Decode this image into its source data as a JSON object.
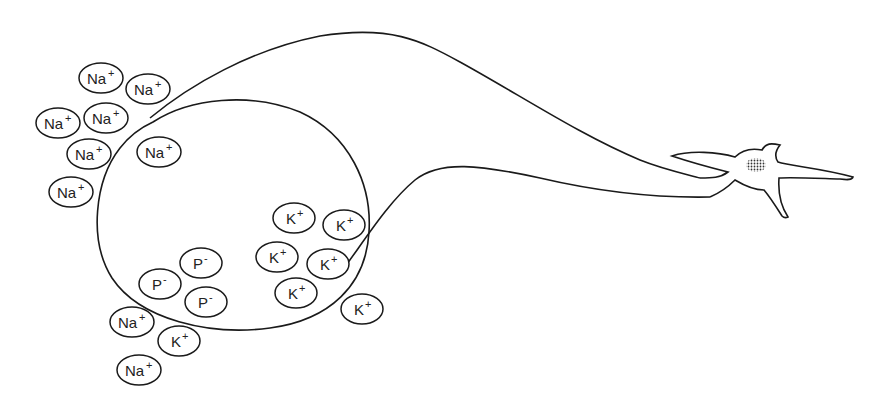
{
  "diagram": {
    "ions": [
      {
        "id": "na-out-1",
        "symbol": "Na",
        "charge": "+",
        "location": "outside",
        "cx": 101,
        "cy": 78
      },
      {
        "id": "na-out-2",
        "symbol": "Na",
        "charge": "+",
        "location": "outside",
        "cx": 148,
        "cy": 89
      },
      {
        "id": "na-out-3",
        "symbol": "Na",
        "charge": "+",
        "location": "outside",
        "cx": 58,
        "cy": 123
      },
      {
        "id": "na-out-4",
        "symbol": "Na",
        "charge": "+",
        "location": "outside",
        "cx": 106,
        "cy": 118
      },
      {
        "id": "na-out-5",
        "symbol": "Na",
        "charge": "+",
        "location": "outside",
        "cx": 89,
        "cy": 154
      },
      {
        "id": "na-out-6",
        "symbol": "Na",
        "charge": "+",
        "location": "outside",
        "cx": 71,
        "cy": 192
      },
      {
        "id": "na-in-1",
        "symbol": "Na",
        "charge": "+",
        "location": "inside",
        "cx": 159,
        "cy": 152
      },
      {
        "id": "k-in-1",
        "symbol": "K",
        "charge": "+",
        "location": "inside",
        "cx": 294,
        "cy": 218
      },
      {
        "id": "k-in-2",
        "symbol": "K",
        "charge": "+",
        "location": "inside",
        "cx": 344,
        "cy": 225
      },
      {
        "id": "k-in-3",
        "symbol": "K",
        "charge": "+",
        "location": "inside",
        "cx": 277,
        "cy": 257
      },
      {
        "id": "k-in-4",
        "symbol": "K",
        "charge": "+",
        "location": "inside",
        "cx": 328,
        "cy": 264
      },
      {
        "id": "k-in-5",
        "symbol": "K",
        "charge": "+",
        "location": "inside",
        "cx": 296,
        "cy": 293
      },
      {
        "id": "k-out-1",
        "symbol": "K",
        "charge": "+",
        "location": "outside",
        "cx": 362,
        "cy": 309
      },
      {
        "id": "p-in-1",
        "symbol": "P",
        "charge": "-",
        "location": "inside",
        "cx": 201,
        "cy": 263
      },
      {
        "id": "p-in-2",
        "symbol": "P",
        "charge": "-",
        "location": "inside",
        "cx": 160,
        "cy": 284
      },
      {
        "id": "p-in-3",
        "symbol": "P",
        "charge": "-",
        "location": "inside",
        "cx": 206,
        "cy": 302
      },
      {
        "id": "na-out-7",
        "symbol": "Na",
        "charge": "+",
        "location": "outside",
        "cx": 132,
        "cy": 322
      },
      {
        "id": "k-out-2",
        "symbol": "K",
        "charge": "+",
        "location": "outside",
        "cx": 179,
        "cy": 341
      },
      {
        "id": "na-out-8",
        "symbol": "Na",
        "charge": "+",
        "location": "outside",
        "cx": 139,
        "cy": 370
      }
    ]
  }
}
